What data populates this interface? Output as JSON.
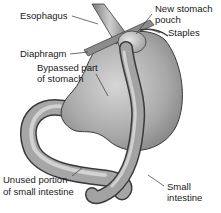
{
  "diagram": {
    "type": "anatomical-illustration",
    "labels": {
      "esophagus": "Esophagus",
      "diaphragm": "Diaphragm",
      "bypassed_stomach_line1": "Bypassed part",
      "bypassed_stomach_line2": "of stomach",
      "new_pouch_line1": "New stomach",
      "new_pouch_line2": "pouch",
      "staples": "Staples",
      "unused_intestine_line1": "Unused portion",
      "unused_intestine_line2": "of small intestine",
      "small_intestine_line1": "Small",
      "small_intestine_line2": "intestine"
    },
    "colors": {
      "organ_fill": "#a8a8a8",
      "organ_light": "#d4d4d4",
      "organ_dark": "#6e6e6e",
      "outline": "#3a3a3a",
      "text": "#1a1a1a",
      "background": "#ffffff"
    }
  }
}
